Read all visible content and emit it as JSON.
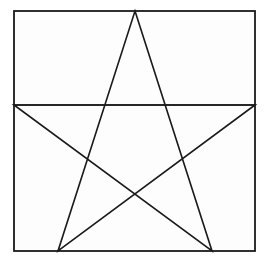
{
  "figure": {
    "title": "Pentagram inscribed in a square",
    "background_color": "#ffffff",
    "interior_color": "#fdfdfd",
    "line_color": "#1a1a1a",
    "line_width": 1.6,
    "border_width": 1.8,
    "canvas": {
      "width": 267,
      "height": 261
    },
    "square": {
      "name": "outer-square-border",
      "left": 14,
      "top": 11,
      "right": 255,
      "bottom": 251,
      "width": 241,
      "height": 240
    },
    "star": {
      "name": "pentagram",
      "point_count": 5,
      "vertices": [
        {
          "label": "top-apex",
          "x": 135,
          "y": 11
        },
        {
          "label": "right-point",
          "x": 255,
          "y": 105
        },
        {
          "label": "bottom-right-point",
          "x": 212,
          "y": 251
        },
        {
          "label": "bottom-left-point",
          "x": 58,
          "y": 251
        },
        {
          "label": "left-point",
          "x": 14,
          "y": 105
        }
      ],
      "path_order": [
        "top-apex",
        "bottom-right-point",
        "left-point",
        "right-point",
        "bottom-left-point",
        "top-apex"
      ],
      "center_crossing": {
        "x": 135,
        "y": 198
      },
      "chord_y": 105
    },
    "chord": {
      "name": "horizontal-chord",
      "x1": 14,
      "y1": 105,
      "x2": 255,
      "y2": 105
    }
  }
}
